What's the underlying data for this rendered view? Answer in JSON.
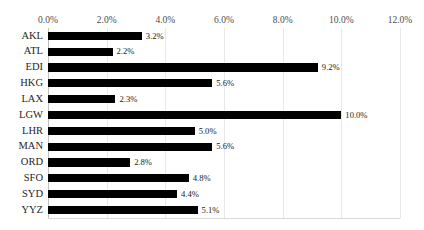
{
  "chart_data": {
    "type": "bar",
    "orientation": "horizontal",
    "title": "",
    "xlabel": "",
    "ylabel": "",
    "categories": [
      "AKL",
      "ATL",
      "EDI",
      "HKG",
      "LAX",
      "LGW",
      "LHR",
      "MAN",
      "ORD",
      "SFO",
      "SYD",
      "YYZ"
    ],
    "values": [
      3.2,
      2.2,
      9.2,
      5.6,
      2.3,
      10.0,
      5.0,
      5.6,
      2.8,
      4.8,
      4.4,
      5.1
    ],
    "value_labels": [
      "3.2%",
      "2.2%",
      "9.2%",
      "5.6%",
      "2.3%",
      "10.0%",
      "5.0%",
      "5.6%",
      "2.8%",
      "4.8%",
      "4.4%",
      "5.1%"
    ],
    "xlim": [
      0.0,
      12.0
    ],
    "xticks": [
      0.0,
      2.0,
      4.0,
      6.0,
      8.0,
      10.0,
      12.0
    ],
    "xtick_labels": [
      "0.0%",
      "2.0%",
      "4.0%",
      "6.0%",
      "8.0%",
      "10.0%",
      "12.0%"
    ],
    "axis_position": "top",
    "grid": true,
    "grid_axis": "x",
    "legend": null,
    "bar_color": "#000000",
    "gridline_color": "#E8E8E8",
    "data_labels": true
  }
}
